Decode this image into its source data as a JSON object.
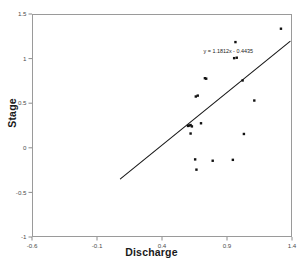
{
  "chart_data": {
    "type": "scatter",
    "title": "",
    "xlabel": "Discharge",
    "ylabel": "Stage",
    "xlim": [
      -0.6,
      1.4
    ],
    "ylim": [
      -1,
      1.5
    ],
    "xticks": [
      -0.6,
      -0.1,
      0.4,
      0.9,
      1.4
    ],
    "xtick_labels": [
      "-0.6",
      "-0.1",
      "0.4",
      "0.9",
      "1.4"
    ],
    "yticks": [
      -1,
      -0.5,
      0,
      0.5,
      1,
      1.5
    ],
    "ytick_labels": [
      "-1",
      "-0.5",
      "0",
      "0.5",
      "1",
      "1.5"
    ],
    "grid": false,
    "legend": null,
    "marker": "square",
    "marker_color": "#111111",
    "points": [
      {
        "x": 0.6,
        "y": 0.245
      },
      {
        "x": 0.61,
        "y": 0.25
      },
      {
        "x": 0.62,
        "y": 0.255
      },
      {
        "x": 0.63,
        "y": 0.24
      },
      {
        "x": 0.62,
        "y": 0.16
      },
      {
        "x": 0.7,
        "y": 0.275
      },
      {
        "x": 0.66,
        "y": 0.575
      },
      {
        "x": 0.675,
        "y": 0.585
      },
      {
        "x": 0.73,
        "y": 0.78
      },
      {
        "x": 0.74,
        "y": 0.775
      },
      {
        "x": 0.955,
        "y": 1.005
      },
      {
        "x": 0.975,
        "y": 1.01
      },
      {
        "x": 0.965,
        "y": 1.185
      },
      {
        "x": 1.02,
        "y": 0.755
      },
      {
        "x": 1.11,
        "y": 0.53
      },
      {
        "x": 1.03,
        "y": 0.155
      },
      {
        "x": 1.315,
        "y": 1.335
      },
      {
        "x": 0.655,
        "y": -0.13
      },
      {
        "x": 0.665,
        "y": -0.245
      },
      {
        "x": 0.79,
        "y": -0.145
      },
      {
        "x": 0.945,
        "y": -0.135
      }
    ],
    "trendline": {
      "equation_label": "y = 1.1812x - 0.4435",
      "slope": 1.1812,
      "intercept": -0.4435,
      "x_start": 0.08,
      "x_end": 1.385,
      "color": "#1a1a1a"
    }
  }
}
